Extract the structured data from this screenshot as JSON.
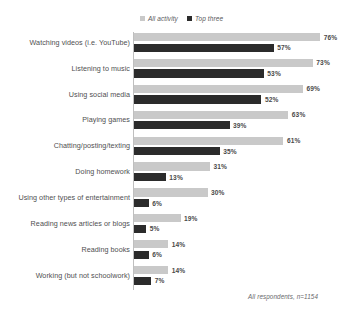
{
  "legend": {
    "items": [
      {
        "label": "All activity",
        "marker": "square-light-icon",
        "color": "#c9c9c9"
      },
      {
        "label": "Top three",
        "marker": "square-dark-icon",
        "color": "#2b2b2b"
      }
    ]
  },
  "footnote": "All respondents, n=1154",
  "chart_data": {
    "type": "bar",
    "title": "",
    "subtitle": "",
    "xlabel": "",
    "ylabel": "",
    "orientation": "horizontal",
    "grid": false,
    "legend_position": "top-center",
    "xlim": [
      0,
      80
    ],
    "unit": "%",
    "categories": [
      "Watching videos (i.e. YouTube)",
      "Listening to music",
      "Using social media",
      "Playing games",
      "Chatting/posting/texting",
      "Doing homework",
      "Using other types of entertainment",
      "Reading news articles or blogs",
      "Reading books",
      "Working (but not schoolwork)"
    ],
    "series": [
      {
        "name": "All activity",
        "color": "#c9c9c9",
        "values": [
          76,
          73,
          69,
          63,
          61,
          31,
          30,
          19,
          14,
          14
        ],
        "labels": [
          "76%",
          "73%",
          "69%",
          "63%",
          "61%",
          "31%",
          "30%",
          "19%",
          "14%",
          "14%"
        ]
      },
      {
        "name": "Top three",
        "color": "#2b2b2b",
        "values": [
          57,
          53,
          52,
          39,
          35,
          13,
          6,
          5,
          6,
          7
        ],
        "labels": [
          "57%",
          "53%",
          "52%",
          "39%",
          "35%",
          "13%",
          "6%",
          "5%",
          "6%",
          "7%"
        ]
      }
    ]
  }
}
